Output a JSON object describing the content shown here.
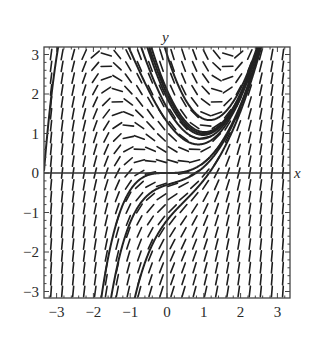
{
  "chart_data": {
    "type": "line",
    "subtype": "slope-field",
    "title": "",
    "xlabel": "x",
    "ylabel": "y",
    "xlim": [
      -3.3,
      3.3
    ],
    "ylim": [
      -3.2,
      3.2
    ],
    "x_ticks": [
      -3,
      -2,
      -1,
      0,
      1,
      2,
      3
    ],
    "y_ticks": [
      -3,
      -2,
      -1,
      0,
      1,
      2,
      3
    ],
    "x_tick_labels": [
      "−3",
      "−2",
      "−1",
      "0",
      "1",
      "2",
      "3"
    ],
    "y_tick_labels": [
      "−3",
      "−2",
      "−1",
      "0",
      "1",
      "2",
      "3"
    ],
    "grid": false,
    "legend": null,
    "differential_equation": "dy/dx = x^2 - y",
    "general_solution": "y = x^2 - 2x + 2 + C e^(-x)",
    "slope_field_grid": {
      "x_step": 0.3,
      "y_step": 0.3
    },
    "series": [
      {
        "name": "solution C=-2 (through origin)",
        "C": -2
      },
      {
        "name": "solution C=-0.1",
        "C": -0.1
      },
      {
        "name": "solution C=0",
        "C": 0
      },
      {
        "name": "solution C=0.1",
        "C": 0.1
      },
      {
        "name": "solution C=1",
        "C": 1
      },
      {
        "name": "solution C=-0.35",
        "C": -0.35
      },
      {
        "name": "solution C=-0.7",
        "C": -0.7
      },
      {
        "name": "solution C=-2.3",
        "C": -2.3
      },
      {
        "name": "solution C=-3.2",
        "C": -3.2
      }
    ]
  },
  "colors": {
    "curve": "#222222",
    "segment": "#1e1e1e",
    "axis": "#333333",
    "frame": "#444444"
  }
}
